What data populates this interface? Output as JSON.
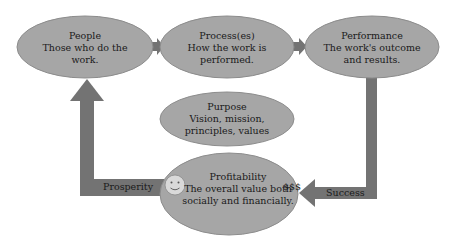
{
  "colors": {
    "ellipse_fill": "#a6a6a6",
    "ellipse_stroke": "#8c8c8c",
    "arrow_fill": "#737373",
    "text": "#1a1a1a",
    "background": "#ffffff"
  },
  "nodes": {
    "people": {
      "title": "People",
      "desc_line1": "Those who do the",
      "desc_line2": "work."
    },
    "process": {
      "title": "Process(es)",
      "desc_line1": "How the work is",
      "desc_line2": "performed."
    },
    "performance": {
      "title": "Performance",
      "desc_line1": "The work's outcome",
      "desc_line2": "and results."
    },
    "purpose": {
      "title": "Purpose",
      "desc_line1": "Vision, mission,",
      "desc_line2": "principles, values"
    },
    "profitability": {
      "title": "Profitability",
      "desc_line1": "The overall value both",
      "desc_line2": "socially and financially.",
      "money_label": "$$$",
      "icon": "smiley-face-icon"
    }
  },
  "arrows": {
    "success_label": "Success",
    "prosperity_label": "Prosperity"
  }
}
